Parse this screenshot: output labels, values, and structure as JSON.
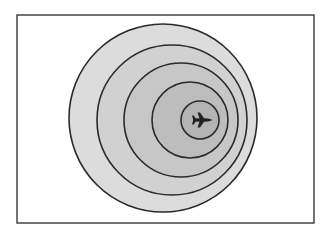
{
  "diagram": {
    "frame": {
      "x": 17,
      "y": 15,
      "width": 297,
      "height": 208,
      "stroke": "#444444",
      "fill": "#ffffff"
    },
    "rings": [
      {
        "name": "ring-1-outer",
        "cx": 163,
        "cy": 118,
        "r": 94,
        "fill": "#dcdcdc"
      },
      {
        "name": "ring-2",
        "cx": 172,
        "cy": 120,
        "r": 75,
        "fill": "#d1d1d1"
      },
      {
        "name": "ring-3",
        "cx": 181,
        "cy": 120,
        "r": 57,
        "fill": "#c7c7c7"
      },
      {
        "name": "ring-4",
        "cx": 190,
        "cy": 120,
        "r": 38,
        "fill": "#bdbdbd"
      },
      {
        "name": "ring-5-inner",
        "cx": 200,
        "cy": 120,
        "r": 19,
        "fill": "#b4b4b4"
      }
    ],
    "ring_stroke": "#2a2a2a",
    "aircraft": {
      "icon": "airplane-icon",
      "cx": 202,
      "cy": 120,
      "heading": "east",
      "color": "#222222"
    }
  }
}
